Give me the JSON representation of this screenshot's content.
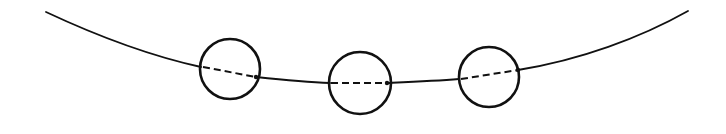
{
  "diagram": {
    "stroke_color": "#111111",
    "background": "#ffffff",
    "curve": {
      "left_segment": "M46,12 C110,42 160,58 201,67",
      "middle_left_segment": "M256,77 C285,80 305,82 330,83",
      "middle_right_segment": "M387,83 C410,82 435,81 459,79",
      "right_segment": "M518,70 C580,60 640,38 688,11"
    },
    "circles": [
      {
        "id": "circle-1",
        "cx": 230,
        "cy": 69,
        "r": 30,
        "dash_from": [
          203,
          67
        ],
        "dash_to": [
          256,
          77
        ]
      },
      {
        "id": "circle-2",
        "cx": 360,
        "cy": 83,
        "r": 31,
        "dash_from": [
          331,
          83
        ],
        "dash_to": [
          387,
          83
        ]
      },
      {
        "id": "circle-3",
        "cx": 489,
        "cy": 77,
        "r": 30,
        "dash_from": [
          461,
          79
        ],
        "dash_to": [
          518,
          70
        ]
      }
    ]
  }
}
